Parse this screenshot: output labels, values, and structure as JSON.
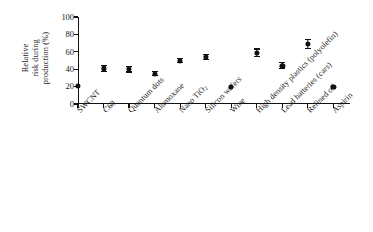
{
  "figure": {
    "ylabel_lines": [
      "Relative",
      "risk during",
      "production (%)"
    ],
    "yticks": [
      0,
      20,
      40,
      60,
      80,
      100
    ],
    "marker_color": "#111111",
    "axis_color": "#111111",
    "background": "#ffffff"
  },
  "chart_data": {
    "type": "scatter",
    "title": "",
    "subtitle": "",
    "xlabel": "",
    "ylabel": "Relative risk during production (%)",
    "ylim": [
      0,
      100
    ],
    "ytick_values": [
      0,
      20,
      40,
      60,
      80,
      100
    ],
    "grid": false,
    "legend": false,
    "legend_position": "none",
    "error_bars": "symmetric vertical, capped",
    "categories": [
      "SWCNT",
      "C60",
      "Quantum dots",
      "Alumoxane",
      "Nano TiO2",
      "Silicon wafers",
      "Wine",
      "High density plastics (polyolefin)",
      "Lead batteries (cars)",
      "Refined oil",
      "Aspirin"
    ],
    "category_labels_html": [
      "SWCNT",
      "C60",
      "Quantum dots",
      "Alumoxane",
      "Nano TiO<sub>2</sub>",
      "Silicon wafers",
      "Wine",
      "High density plastics (polyolefin)",
      "Lead batteries (cars)",
      "Refined oil",
      "Aspirin"
    ],
    "values": [
      21,
      41,
      40,
      35,
      50,
      54,
      20,
      59,
      44,
      69,
      20
    ],
    "errors": [
      0,
      4,
      4,
      3,
      3,
      4,
      0,
      5,
      4,
      6,
      0
    ],
    "series": [
      {
        "name": "Relative risk during production (%)",
        "values": [
          21,
          41,
          40,
          35,
          50,
          54,
          20,
          59,
          44,
          69,
          20
        ],
        "errors": [
          0,
          4,
          4,
          3,
          3,
          4,
          0,
          5,
          4,
          6,
          0
        ]
      }
    ]
  }
}
